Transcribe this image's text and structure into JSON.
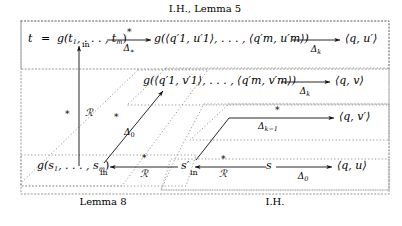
{
  "figure": {
    "type": "commutative-diagram"
  },
  "region_labels": {
    "top": "I.H., Lemma 5",
    "bottom_left": "Lemma 8",
    "bottom_right": "I.H."
  },
  "nodes": {
    "t_term": "t",
    "equals": "=",
    "g_t": "g(t",
    "g_t_sub1": "1",
    "g_t_dots": ", . . . , t",
    "g_t_subm": "m",
    "g_t_close": ")",
    "g_qu": "g(⟨q",
    "g_qu_s1": "1",
    "g_qu_prime": "′",
    "row1_target": "⟨q, u′⟩",
    "row2_target": "⟨q, v⟩",
    "row3_target": "⟨q, v′⟩",
    "row4_target": "⟨q, u⟩",
    "s_prime": "s′",
    "s_node": "s",
    "g_s": "g(s",
    "g_s_sub1": "1",
    "g_s_dots": ", . . . , s",
    "g_s_subm": "m",
    "g_s_close": ")"
  },
  "tuples": {
    "row1": "g(⟨q′1, u′1⟩, . . . , ⟨q′m, u′m⟩)",
    "row2": "g(⟨q′1, v′1⟩, . . . , ⟨q′m, v′m⟩)"
  },
  "arrow_labels": {
    "row1_above": "∗",
    "row1_below": "Δ",
    "row1_below_sub": "∗",
    "row1_right_below": "Δ",
    "row1_right_below_sub": "k",
    "row2_below": "Δ",
    "row2_below_sub": "k",
    "row3_above": "∗",
    "row3_below": "Δ",
    "row3_below_sub": "k−1",
    "row4_below": "Δ",
    "row4_below_sub": "0",
    "vertical_left": "∗",
    "vertical_right": "ℛ",
    "vertical_tip": "in",
    "diag1_above": "∗",
    "diag1_below": "Δ",
    "diag1_below_sub": "0",
    "bottom_in_1": "in",
    "bottom_R_1": "ℛ",
    "bottom_star_1": "∗",
    "bottom_in_2": "in",
    "bottom_R_2": "ℛ",
    "bottom_star_2": "∗",
    "mid_star": "∗"
  },
  "colors": {
    "ink": "#000000",
    "box_dotted": "#777777",
    "background": "#ffffff"
  }
}
